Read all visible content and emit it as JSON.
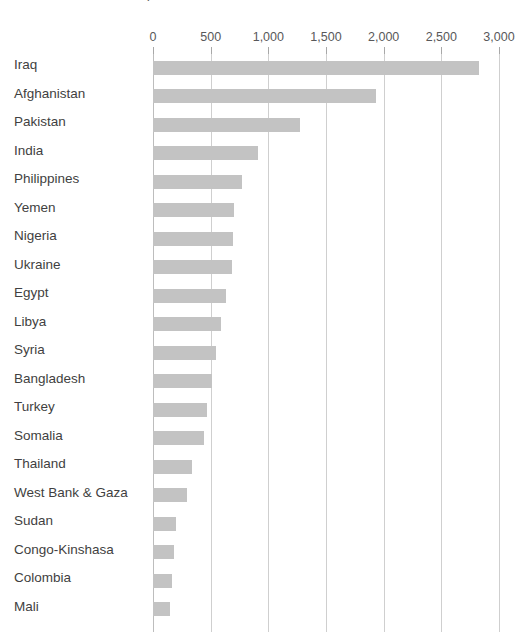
{
  "chart": {
    "title": "Number of incidents, 20xx",
    "title_note": "clipped at top edge of screenshot"
  },
  "axis": {
    "tick_labels": [
      "0",
      "500",
      "1,000",
      "1,500",
      "2,000",
      "2,500",
      "3,000"
    ],
    "tick_values": [
      0,
      500,
      1000,
      1500,
      2000,
      2500,
      3000
    ]
  },
  "colors": {
    "bar_fill": "#c3c3c3",
    "gridline": "#cfcfcf",
    "axis_line": "#bdbdbd",
    "label_text": "#3f3f41",
    "tick_text": "#58585a",
    "background": "#ffffff"
  },
  "chart_data": {
    "type": "bar",
    "orientation": "horizontal",
    "title": "Number of incidents, 20xx",
    "subtitle": "",
    "xlabel": "",
    "ylabel": "",
    "xlim": [
      0,
      3000
    ],
    "grid": true,
    "legend": "none",
    "categories": [
      "Iraq",
      "Afghanistan",
      "Pakistan",
      "India",
      "Philippines",
      "Yemen",
      "Nigeria",
      "Ukraine",
      "Egypt",
      "Libya",
      "Syria",
      "Bangladesh",
      "Turkey",
      "Somalia",
      "Thailand",
      "West Bank & Gaza",
      "Sudan",
      "Congo-Kinshasa",
      "Colombia",
      "Mali"
    ],
    "values": [
      2830,
      1930,
      1275,
      910,
      770,
      700,
      690,
      685,
      635,
      590,
      545,
      515,
      470,
      440,
      340,
      295,
      200,
      185,
      165,
      150
    ],
    "axis_ticks": [
      0,
      500,
      1000,
      1500,
      2000,
      2500,
      3000
    ],
    "axis_tick_labels": [
      "0",
      "500",
      "1,000",
      "1,500",
      "2,000",
      "2,500",
      "3,000"
    ]
  }
}
